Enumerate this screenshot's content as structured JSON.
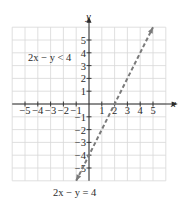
{
  "chart_data": {
    "type": "line",
    "title": "",
    "xlabel": "x",
    "ylabel": "y",
    "xlim": [
      -6,
      6
    ],
    "ylim": [
      -6,
      6
    ],
    "grid": true,
    "x_ticks": [
      -5,
      -4,
      -3,
      -2,
      -1,
      1,
      2,
      3,
      4,
      5
    ],
    "y_ticks": [
      -5,
      -4,
      -3,
      -2,
      -1,
      1,
      2,
      3,
      4,
      5
    ],
    "x_tick_labels": [
      "−5",
      "−4",
      "−3",
      "−2",
      "−1",
      "1",
      "2",
      "3",
      "4",
      "5"
    ],
    "y_tick_labels": [
      "−5",
      "−4",
      "−3",
      "−2",
      "−1",
      "1",
      "2",
      "3",
      "4",
      "5"
    ],
    "series": [
      {
        "name": "2x − y = 4",
        "style": "dashed",
        "equation": "y = 2x − 4",
        "x": [
          -1,
          5
        ],
        "y": [
          -6,
          6
        ]
      }
    ],
    "annotations": [
      {
        "text": "2x − y < 4",
        "x": -3.5,
        "y": 3.5
      },
      {
        "text": "2x − y = 4",
        "x": -0.5,
        "y": -7.2
      }
    ],
    "colors": {
      "line": "#7a7a7a",
      "grid": "#d8d8d8",
      "axis": "#2a2a2a"
    }
  },
  "labels": {
    "x_axis": "x",
    "y_axis": "y",
    "inequality": "2x − y < 4",
    "boundary": "2x − y = 4"
  }
}
